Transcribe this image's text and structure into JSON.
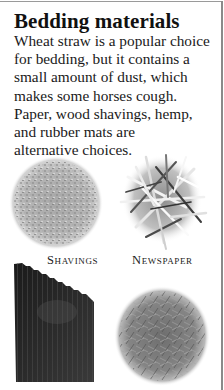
{
  "section": {
    "title": "Bedding materials",
    "body_lines": [
      "Wheat straw is a popular choice",
      "for bedding, but it contains a",
      "small amount of dust, which",
      "makes some horses cough.",
      "Paper, wood shavings, hemp,",
      "and rubber mats are",
      "alternative choices."
    ]
  },
  "images": [
    {
      "name": "shavings-photo",
      "caption": "Shavings"
    },
    {
      "name": "newspaper-photo",
      "caption": "Newspaper"
    },
    {
      "name": "rubber-mat-photo",
      "caption": ""
    },
    {
      "name": "hemp-photo",
      "caption": ""
    }
  ],
  "colors": {
    "border": "#8a8a8a",
    "text": "#1a1a1a",
    "background": "#ffffff"
  }
}
